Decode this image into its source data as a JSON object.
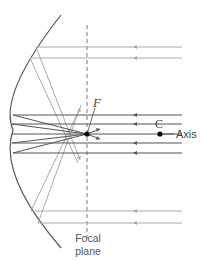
{
  "diagram": {
    "type": "concave-mirror-ray-diagram",
    "labels": {
      "focal_point": "F",
      "center_of_curvature": "C",
      "axis": "Axis",
      "focal_plane_line1": "Focal",
      "focal_plane_line2": "plane"
    },
    "colors": {
      "mirror": "#555555",
      "paraxial_rays": "#555555",
      "marginal_rays": "#aaaaaa",
      "focal_plane": "#777777",
      "points": "#000000"
    },
    "elements": {
      "mirror": "spherical concave mirror arc",
      "focal_plane": "dashed vertical line through F",
      "paraxial_ray_count": 5,
      "marginal_ray_count": 4
    }
  }
}
